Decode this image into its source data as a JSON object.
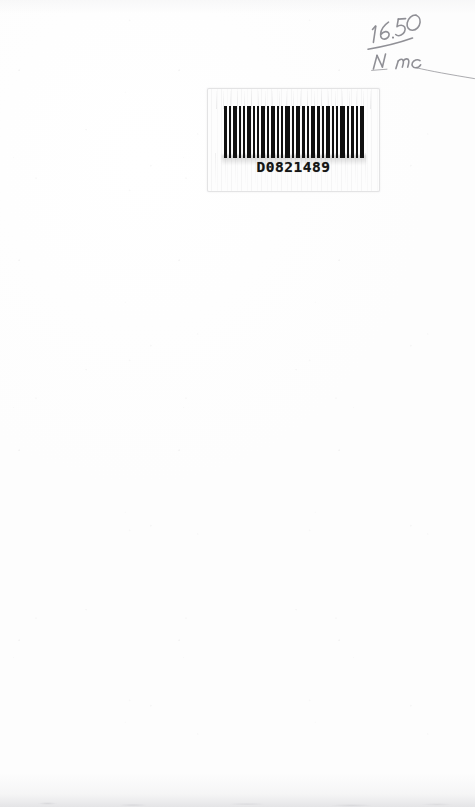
{
  "document": {
    "type": "scanned-page",
    "background_color": "#fefefe",
    "width": 475,
    "height": 807
  },
  "barcode_label": {
    "name": "barcode-label",
    "code_text": "D0821489",
    "symbology": "code-39",
    "bar_color": "#101010",
    "label_background": "#fdfdfd",
    "label_border_color": "#cdcdd0",
    "bar_pattern": [
      {
        "x": 0,
        "w": 3
      },
      {
        "x": 5,
        "w": 2
      },
      {
        "x": 9,
        "w": 4
      },
      {
        "x": 15,
        "w": 2
      },
      {
        "x": 19,
        "w": 2
      },
      {
        "x": 23,
        "w": 4
      },
      {
        "x": 29,
        "w": 2
      },
      {
        "x": 33,
        "w": 2
      },
      {
        "x": 37,
        "w": 4
      },
      {
        "x": 43,
        "w": 2
      },
      {
        "x": 47,
        "w": 4
      },
      {
        "x": 53,
        "w": 2
      },
      {
        "x": 57,
        "w": 2
      },
      {
        "x": 61,
        "w": 5
      },
      {
        "x": 68,
        "w": 2
      },
      {
        "x": 72,
        "w": 4
      },
      {
        "x": 78,
        "w": 3
      },
      {
        "x": 83,
        "w": 2
      },
      {
        "x": 87,
        "w": 4
      },
      {
        "x": 93,
        "w": 3
      },
      {
        "x": 98,
        "w": 2
      },
      {
        "x": 102,
        "w": 4
      },
      {
        "x": 108,
        "w": 2
      },
      {
        "x": 112,
        "w": 2
      },
      {
        "x": 116,
        "w": 5
      },
      {
        "x": 123,
        "w": 2
      },
      {
        "x": 127,
        "w": 3
      },
      {
        "x": 132,
        "w": 2
      },
      {
        "x": 136,
        "w": 4
      }
    ]
  },
  "handwritten_note": {
    "name": "handwritten-price-note",
    "numerator": "16.50",
    "denominator": "N mc",
    "full_text": "16.50 / N mc",
    "medium": "pencil",
    "ink_color": "#8a8a90",
    "has_trailing_stroke": true
  }
}
